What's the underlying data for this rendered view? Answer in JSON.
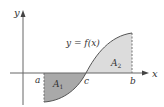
{
  "figure": {
    "axes": {
      "x_label": "x",
      "y_label": "y"
    },
    "curve_label": "y = f(x)",
    "points": {
      "a": "a",
      "c": "c",
      "b": "b"
    },
    "regions": [
      {
        "name": "A",
        "subscript": "1",
        "fill": "#a9a9a9",
        "position": "below x-axis between a and c"
      },
      {
        "name": "A",
        "subscript": "2",
        "fill": "#dcdcdc",
        "position": "above x-axis between c and b"
      }
    ],
    "colors": {
      "axis": "#555555",
      "curve": "#555555",
      "region_A1": "#a9a9a9",
      "region_A2": "#dcdcdc"
    }
  }
}
